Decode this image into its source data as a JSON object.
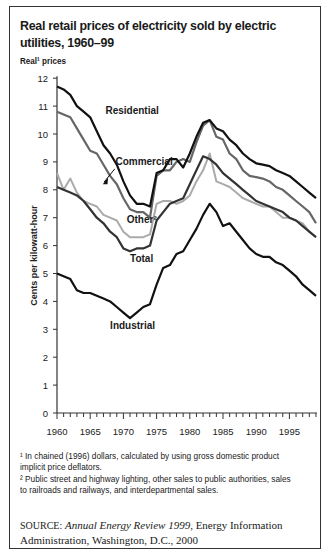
{
  "title": "Real retail prices of electricity sold by electric utilities, 1960–99",
  "y_top_label": "Real¹ prices",
  "footnotes": [
    "¹ In chained (1996) dollars, calculated by using gross domestic product implicit price deflators.",
    "² Public street and highway lighting, other sales to public authorities, sales to railroads and railways, and interdepartmental sales."
  ],
  "source": {
    "label": "SOURCE:",
    "title": "Annual Energy Review 1999",
    "rest": ", Energy Information Administration, Washington, D.C., 2000"
  },
  "chart_data": {
    "type": "line",
    "title": "Real retail prices of electricity sold by electric utilities, 1960–99",
    "xlabel": "",
    "ylabel": "Cents per kilowatt-hour",
    "ylim": [
      0,
      12
    ],
    "xlim": [
      1960,
      1999
    ],
    "yticks": [
      0,
      1,
      2,
      3,
      4,
      5,
      6,
      7,
      8,
      9,
      10,
      11,
      12
    ],
    "xticks": [
      1960,
      1965,
      1970,
      1975,
      1980,
      1985,
      1990,
      1995
    ],
    "grid": false,
    "legend": "inline labels",
    "x": [
      1960,
      1961,
      1962,
      1963,
      1964,
      1965,
      1966,
      1967,
      1968,
      1969,
      1970,
      1971,
      1972,
      1973,
      1974,
      1975,
      1976,
      1977,
      1978,
      1979,
      1980,
      1981,
      1982,
      1983,
      1984,
      1985,
      1986,
      1987,
      1988,
      1989,
      1990,
      1991,
      1992,
      1993,
      1994,
      1995,
      1996,
      1997,
      1998,
      1999
    ],
    "series": [
      {
        "name": "Residential",
        "color": "#111111",
        "width": 2.2,
        "values": [
          11.7,
          11.6,
          11.4,
          11.0,
          10.8,
          10.6,
          10.1,
          9.6,
          9.3,
          8.9,
          8.3,
          7.8,
          7.5,
          7.5,
          7.4,
          8.6,
          8.7,
          9.1,
          9.1,
          8.8,
          9.3,
          9.9,
          10.4,
          10.5,
          10.2,
          10.1,
          9.8,
          9.6,
          9.3,
          9.1,
          8.95,
          8.9,
          8.85,
          8.7,
          8.6,
          8.5,
          8.3,
          8.1,
          7.9,
          7.7
        ]
      },
      {
        "name": "Commercial",
        "color": "#666666",
        "width": 2.2,
        "values": [
          10.8,
          10.7,
          10.6,
          10.2,
          9.8,
          9.4,
          9.3,
          8.9,
          8.5,
          8.2,
          7.7,
          7.3,
          7.2,
          7.2,
          7.0,
          8.5,
          8.7,
          8.7,
          9.0,
          9.1,
          9.0,
          9.7,
          10.3,
          10.5,
          9.9,
          9.8,
          9.3,
          9.1,
          8.7,
          8.5,
          8.45,
          8.4,
          8.3,
          8.1,
          8.0,
          7.8,
          7.6,
          7.4,
          7.2,
          6.8
        ]
      },
      {
        "name": "Other²",
        "color": "#aaaaaa",
        "width": 2.0,
        "values": [
          8.6,
          8.0,
          8.4,
          7.9,
          7.6,
          7.5,
          7.4,
          7.1,
          7.0,
          6.9,
          6.5,
          6.3,
          6.3,
          6.3,
          6.4,
          7.5,
          7.6,
          7.6,
          7.5,
          7.6,
          7.8,
          8.3,
          8.7,
          9.3,
          8.3,
          8.2,
          8.1,
          7.9,
          7.7,
          7.6,
          7.5,
          7.4,
          7.4,
          7.2,
          7.0,
          7.0,
          6.9,
          6.8,
          6.5,
          6.3
        ]
      },
      {
        "name": "Total",
        "color": "#333333",
        "width": 2.2,
        "values": [
          8.1,
          8.0,
          7.9,
          7.8,
          7.6,
          7.3,
          7.0,
          6.8,
          6.5,
          6.3,
          5.9,
          5.8,
          5.9,
          5.9,
          6.0,
          6.9,
          7.2,
          7.5,
          7.6,
          7.7,
          8.2,
          8.7,
          9.2,
          9.1,
          8.9,
          8.6,
          8.4,
          8.2,
          8.0,
          7.8,
          7.6,
          7.5,
          7.4,
          7.3,
          7.2,
          7.0,
          6.9,
          6.7,
          6.5,
          6.3
        ]
      },
      {
        "name": "Industrial",
        "color": "#111111",
        "width": 2.2,
        "values": [
          5.0,
          4.9,
          4.8,
          4.4,
          4.3,
          4.3,
          4.2,
          4.1,
          4.0,
          3.8,
          3.6,
          3.4,
          3.6,
          3.8,
          3.9,
          4.6,
          5.2,
          5.3,
          5.7,
          5.8,
          6.2,
          6.6,
          7.1,
          7.5,
          7.2,
          6.7,
          6.8,
          6.5,
          6.2,
          5.9,
          5.7,
          5.6,
          5.6,
          5.4,
          5.3,
          5.1,
          4.9,
          4.6,
          4.4,
          4.2
        ]
      }
    ],
    "annotations": [
      {
        "text": "Residential",
        "x": 1967.3,
        "y": 10.7
      },
      {
        "text": "Commercial",
        "x": 1968.8,
        "y": 8.9
      },
      {
        "text": "Other²",
        "x": 1970.5,
        "y": 6.8
      },
      {
        "text": "Total",
        "x": 1971.0,
        "y": 5.4
      },
      {
        "text": "Industrial",
        "x": 1968.0,
        "y": 3.0
      }
    ]
  }
}
